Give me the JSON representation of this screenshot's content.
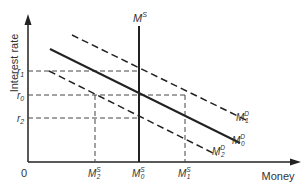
{
  "axes": {
    "y_label": "Interest rate",
    "x_label": "Money",
    "origin": "0"
  },
  "rates": {
    "r1": {
      "base": "r",
      "sub": "1"
    },
    "r0": {
      "base": "r",
      "sub": "0"
    },
    "r2": {
      "base": "r",
      "sub": "2"
    }
  },
  "supply": {
    "top": {
      "base": "M",
      "sup": "S"
    },
    "m2": {
      "base": "M",
      "sup": "S",
      "sub": "2"
    },
    "m0": {
      "base": "M",
      "sup": "S",
      "sub": "0"
    },
    "m1": {
      "base": "M",
      "sup": "S",
      "sub": "1"
    }
  },
  "demand": {
    "d1": {
      "base": "M",
      "sup": "D",
      "sub": "1"
    },
    "d0": {
      "base": "M",
      "sup": "D",
      "sub": "0"
    },
    "d2": {
      "base": "M",
      "sup": "D",
      "sub": "2"
    }
  },
  "colors": {
    "line": "#222222",
    "dash": "#444444"
  }
}
